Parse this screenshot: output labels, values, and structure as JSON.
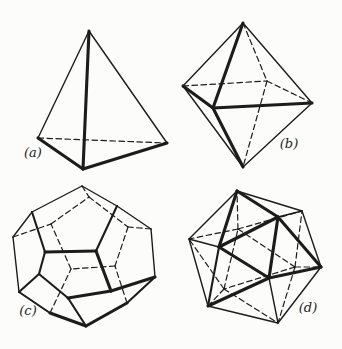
{
  "page": {
    "background_color": "#fcfcfa",
    "ink_color": "#1c1c1c"
  },
  "figures": [
    {
      "name": "tetrahedron",
      "label": "(a)",
      "shape": {
        "vertices": {
          "apex": [
            89,
            31
          ],
          "left": [
            38,
            138
          ],
          "right": [
            167,
            143
          ],
          "front": [
            83,
            169
          ]
        },
        "edges": [
          [
            "left",
            "right",
            "dashed"
          ],
          [
            "apex",
            "left",
            "thin"
          ],
          [
            "apex",
            "right",
            "thin"
          ],
          [
            "apex",
            "front",
            "thick"
          ],
          [
            "left",
            "front",
            "thick"
          ],
          [
            "front",
            "right",
            "thick"
          ]
        ]
      }
    },
    {
      "name": "octahedron",
      "label": "(b)",
      "shape": {
        "vertices": {
          "top": [
            243,
            23
          ],
          "left": [
            183,
            86
          ],
          "front": [
            213,
            108
          ],
          "right": [
            312,
            103
          ],
          "back": [
            267,
            81
          ],
          "bottom": [
            243,
            167
          ]
        },
        "edges": [
          [
            "top",
            "back",
            "dashed"
          ],
          [
            "left",
            "back",
            "dashed"
          ],
          [
            "back",
            "right",
            "dashed"
          ],
          [
            "back",
            "bottom",
            "dashed"
          ],
          [
            "top",
            "left",
            "thin"
          ],
          [
            "top",
            "right",
            "thin"
          ],
          [
            "left",
            "bottom",
            "thin"
          ],
          [
            "right",
            "bottom",
            "thin"
          ],
          [
            "top",
            "front",
            "thick"
          ],
          [
            "left",
            "front",
            "thick"
          ],
          [
            "front",
            "right",
            "thick"
          ],
          [
            "front",
            "bottom",
            "thick"
          ]
        ]
      }
    },
    {
      "name": "dodecahedron",
      "label": "(c)",
      "shape": {
        "vertices": {
          "d0": [
            82,
            186
          ],
          "d1": [
            117,
            206
          ],
          "d2": [
            151,
            229
          ],
          "d3": [
            155,
            277
          ],
          "d4": [
            127,
            303
          ],
          "d5": [
            86,
            326
          ],
          "d6": [
            50,
            313
          ],
          "d7": [
            19,
            292
          ],
          "d8": [
            13,
            237
          ],
          "d9": [
            32,
            212
          ],
          "f0": [
            45,
            252
          ],
          "f1": [
            96,
            251
          ],
          "f2": [
            111,
            291
          ],
          "f3": [
            68,
            298
          ],
          "f4": [
            39,
            274
          ],
          "b0": [
            89,
            197
          ],
          "b1": [
            128,
            227
          ],
          "b2": [
            115,
            266
          ],
          "b3": [
            71,
            269
          ],
          "b4": [
            51,
            224
          ]
        },
        "edges": [
          [
            "d0",
            "b0",
            "dashed"
          ],
          [
            "d2",
            "b1",
            "dashed"
          ],
          [
            "d4",
            "b2",
            "dashed"
          ],
          [
            "d6",
            "b3",
            "dashed"
          ],
          [
            "d8",
            "b4",
            "dashed"
          ],
          [
            "b0",
            "b1",
            "dashed"
          ],
          [
            "b1",
            "b2",
            "dashed"
          ],
          [
            "b2",
            "b3",
            "dashed"
          ],
          [
            "b3",
            "b4",
            "dashed"
          ],
          [
            "b4",
            "b0",
            "dashed"
          ],
          [
            "d0",
            "d1",
            "thin"
          ],
          [
            "d1",
            "d2",
            "thin"
          ],
          [
            "d2",
            "d3",
            "thin"
          ],
          [
            "d7",
            "d8",
            "thin"
          ],
          [
            "d8",
            "d9",
            "thin"
          ],
          [
            "d9",
            "d0",
            "thin"
          ],
          [
            "d3",
            "d4",
            "medium"
          ],
          [
            "d6",
            "d7",
            "medium"
          ],
          [
            "d9",
            "f0",
            "medium"
          ],
          [
            "d1",
            "f1",
            "medium"
          ],
          [
            "d5",
            "f3",
            "medium"
          ],
          [
            "d7",
            "f4",
            "medium"
          ],
          [
            "f3",
            "f4",
            "medium"
          ],
          [
            "f4",
            "f0",
            "medium"
          ],
          [
            "d4",
            "d5",
            "thick"
          ],
          [
            "d5",
            "d6",
            "thick"
          ],
          [
            "d3",
            "f2",
            "thick"
          ],
          [
            "f0",
            "f1",
            "thick"
          ],
          [
            "f1",
            "f2",
            "thick"
          ],
          [
            "f2",
            "f3",
            "thick"
          ]
        ]
      }
    },
    {
      "name": "icosahedron",
      "label": "(d)",
      "shape": {
        "vertices": {
          "h0": [
            237,
            191
          ],
          "h1": [
            302,
            211
          ],
          "h2": [
            321,
            267
          ],
          "h3": [
            278,
            323
          ],
          "h4": [
            208,
            306
          ],
          "h5": [
            189,
            239
          ],
          "f0": [
            219,
            247
          ],
          "f1": [
            278,
            217
          ],
          "f2": [
            269,
            278
          ],
          "b0": [
            238,
            229
          ],
          "b1": [
            295,
            267
          ],
          "b2": [
            224,
            289
          ]
        },
        "edges": [
          [
            "b0",
            "b1",
            "dashed"
          ],
          [
            "b1",
            "b2",
            "dashed"
          ],
          [
            "b2",
            "b0",
            "dashed"
          ],
          [
            "b0",
            "h5",
            "dashed"
          ],
          [
            "b0",
            "h0",
            "dashed"
          ],
          [
            "b0",
            "h1",
            "dashed"
          ],
          [
            "b1",
            "h1",
            "dashed"
          ],
          [
            "b1",
            "h2",
            "dashed"
          ],
          [
            "b1",
            "h3",
            "dashed"
          ],
          [
            "b2",
            "h3",
            "dashed"
          ],
          [
            "b2",
            "h4",
            "dashed"
          ],
          [
            "b2",
            "h5",
            "dashed"
          ],
          [
            "h0",
            "h1",
            "thin"
          ],
          [
            "h1",
            "h2",
            "thin"
          ],
          [
            "h2",
            "h3",
            "thin"
          ],
          [
            "h3",
            "h4",
            "thin"
          ],
          [
            "h4",
            "h5",
            "thin"
          ],
          [
            "h5",
            "h0",
            "thin"
          ],
          [
            "h5",
            "f0",
            "thin"
          ],
          [
            "h1",
            "f1",
            "thin"
          ],
          [
            "h3",
            "f2",
            "thin"
          ],
          [
            "h4",
            "f0",
            "medium"
          ],
          [
            "f0",
            "f1",
            "thick"
          ],
          [
            "f1",
            "f2",
            "thick"
          ],
          [
            "f2",
            "f0",
            "thick"
          ],
          [
            "h0",
            "f0",
            "thick"
          ],
          [
            "h0",
            "f1",
            "thick"
          ],
          [
            "h2",
            "f1",
            "thick"
          ],
          [
            "h2",
            "f2",
            "thick"
          ],
          [
            "h4",
            "f2",
            "thick"
          ]
        ]
      }
    }
  ]
}
